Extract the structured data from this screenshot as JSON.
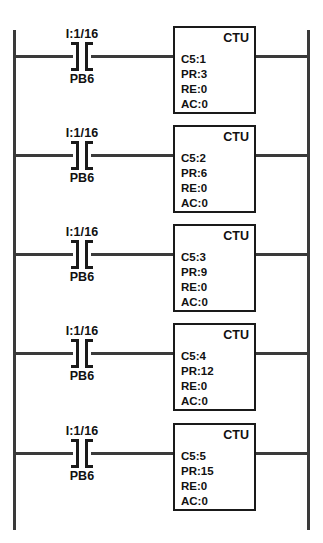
{
  "diagram": {
    "background_color": "#ffffff",
    "line_color": "#3a3a3a",
    "text_color": "#111111"
  },
  "rails": {
    "left_label": "left-power-rail",
    "right_label": "right-power-rail"
  },
  "rungs": [
    {
      "contact": {
        "address": "I:1/16",
        "name": "PB6",
        "type": "normally-open-contact"
      },
      "instruction": {
        "type": "CTU",
        "counter": "C5:1",
        "preset": "PR:3",
        "reset": "RE:0",
        "accumulator": "AC:0"
      }
    },
    {
      "contact": {
        "address": "I:1/16",
        "name": "PB6",
        "type": "normally-open-contact"
      },
      "instruction": {
        "type": "CTU",
        "counter": "C5:2",
        "preset": "PR:6",
        "reset": "RE:0",
        "accumulator": "AC:0"
      }
    },
    {
      "contact": {
        "address": "I:1/16",
        "name": "PB6",
        "type": "normally-open-contact"
      },
      "instruction": {
        "type": "CTU",
        "counter": "C5:3",
        "preset": "PR:9",
        "reset": "RE:0",
        "accumulator": "AC:0"
      }
    },
    {
      "contact": {
        "address": "I:1/16",
        "name": "PB6",
        "type": "normally-open-contact"
      },
      "instruction": {
        "type": "CTU",
        "counter": "C5:4",
        "preset": "PR:12",
        "reset": "RE:0",
        "accumulator": "AC:0"
      }
    },
    {
      "contact": {
        "address": "I:1/16",
        "name": "PB6",
        "type": "normally-open-contact"
      },
      "instruction": {
        "type": "CTU",
        "counter": "C5:5",
        "preset": "PR:15",
        "reset": "RE:0",
        "accumulator": "AC:0"
      }
    }
  ],
  "layout": {
    "rung_tops": [
      31,
      130,
      229,
      328,
      428
    ]
  }
}
